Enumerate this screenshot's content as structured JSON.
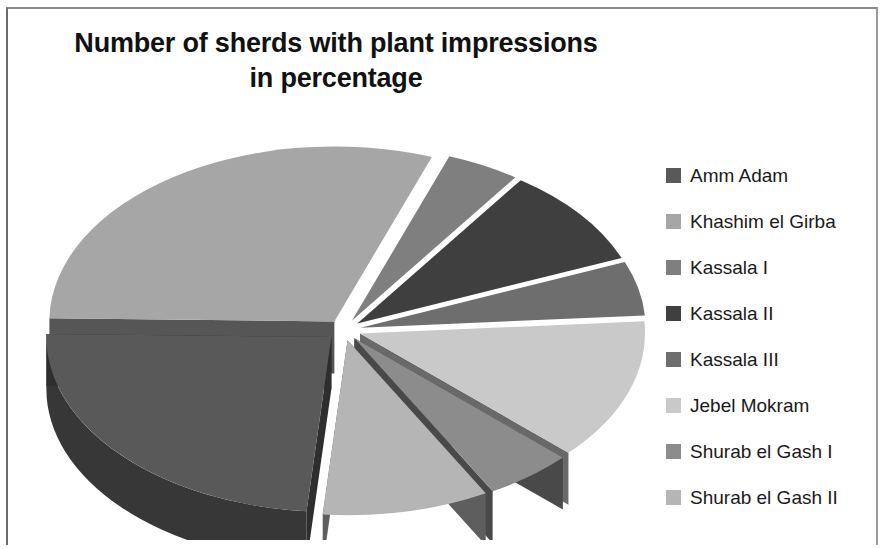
{
  "title": {
    "line1": "Number of sherds with plant impressions",
    "line2": "in percentage"
  },
  "legend": {
    "position": "right",
    "items": [
      {
        "label": "Amm Adam",
        "color": "#595959"
      },
      {
        "label": "Khashim el Girba",
        "color": "#a6a6a6"
      },
      {
        "label": "Kassala I",
        "color": "#7f7f7f"
      },
      {
        "label": "Kassala II",
        "color": "#3f3f3f"
      },
      {
        "label": "Kassala III",
        "color": "#6e6e6e"
      },
      {
        "label": "Jebel Mokram",
        "color": "#c9c9c9"
      },
      {
        "label": "Shurab el Gash I",
        "color": "#8c8c8c"
      },
      {
        "label": "Shurab el Gash II",
        "color": "#b5b5b5"
      }
    ]
  },
  "chart_data": {
    "type": "pie",
    "title": "Number of sherds with plant impressions in percentage",
    "subtitle": "",
    "xlabel": "",
    "ylabel": "",
    "units": "percent",
    "exploded": true,
    "three_d": true,
    "legend_position": "right",
    "grid": false,
    "labels": [
      "Amm Adam",
      "Khashim el Girba",
      "Kassala I",
      "Kassala II",
      "Kassala III",
      "Jebel Mokram",
      "Shurab el Gash I",
      "Shurab el Gash II"
    ],
    "values": [
      24,
      30,
      4,
      9,
      5,
      13,
      5,
      10
    ],
    "colors": [
      "#595959",
      "#a6a6a6",
      "#7f7f7f",
      "#3f3f3f",
      "#6e6e6e",
      "#c9c9c9",
      "#8c8c8c",
      "#b5b5b5"
    ],
    "slices": [
      {
        "label": "Amm Adam",
        "value": 24,
        "color": "#595959",
        "start_angle": 95,
        "end_angle": 181
      },
      {
        "label": "Khashim el Girba",
        "value": 30,
        "color": "#a6a6a6",
        "start_angle": 181,
        "end_angle": 290
      },
      {
        "label": "Kassala I",
        "value": 4,
        "color": "#7f7f7f",
        "start_angle": 290,
        "end_angle": 305
      },
      {
        "label": "Kassala II",
        "value": 9,
        "color": "#3f3f3f",
        "start_angle": 305,
        "end_angle": 338
      },
      {
        "label": "Kassala III",
        "value": 5,
        "color": "#6e6e6e",
        "start_angle": 338,
        "end_angle": 356
      },
      {
        "label": "Jebel Mokram",
        "value": 13,
        "color": "#c9c9c9",
        "start_angle": 356,
        "end_angle": 403
      },
      {
        "label": "Shurab el Gash I",
        "value": 5,
        "color": "#8c8c8c",
        "start_angle": 403,
        "end_angle": 421
      },
      {
        "label": "Shurab el Gash II",
        "value": 10,
        "color": "#b5b5b5",
        "start_angle": 421,
        "end_angle": 455
      }
    ]
  },
  "geometry": {
    "cx": 330,
    "cy": 190,
    "rx": 285,
    "ry": 175,
    "depth": 52,
    "explode": 17
  }
}
